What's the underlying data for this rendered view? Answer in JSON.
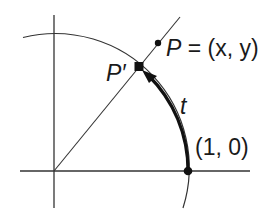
{
  "diagram": {
    "type": "unit-circle-arc-length",
    "labels": {
      "point_p": "P = (x, y)",
      "point_p_var": "P",
      "point_p_coords": "= (x, y)",
      "point_p_prime": "P′",
      "arc_length": "t",
      "unit_point": "(1, 0)"
    },
    "colors": {
      "stroke": "#222222",
      "background": "#ffffff"
    },
    "elements": [
      {
        "name": "x-axis",
        "kind": "line"
      },
      {
        "name": "y-axis",
        "kind": "line"
      },
      {
        "name": "unit-circle-arc",
        "kind": "arc"
      },
      {
        "name": "ray-through-p",
        "kind": "line"
      },
      {
        "name": "arc-t-arrow",
        "kind": "bold-arc-with-arrowhead",
        "from": "(1, 0)",
        "to": "P′"
      },
      {
        "name": "point-p",
        "kind": "dot"
      },
      {
        "name": "point-p-prime",
        "kind": "dot"
      },
      {
        "name": "point-1-0",
        "kind": "dot"
      }
    ]
  }
}
